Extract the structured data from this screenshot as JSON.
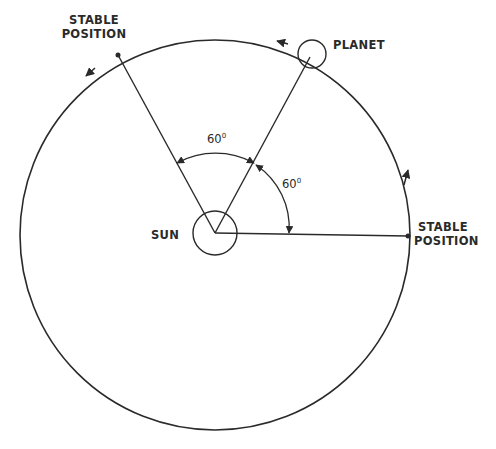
{
  "diagram": {
    "labels": {
      "stable_left_line1": "STABLE",
      "stable_left_line2": "POSITION",
      "planet": "PLANET",
      "sun": "SUN",
      "stable_right_line1": "STABLE",
      "stable_right_line2": "POSITION"
    },
    "angles": {
      "angle_top_value": "60",
      "angle_top_unit": "0",
      "angle_right_value": "60",
      "angle_right_unit": "0"
    },
    "colors": {
      "line": "#2a2a2a",
      "background": "#ffffff"
    }
  }
}
